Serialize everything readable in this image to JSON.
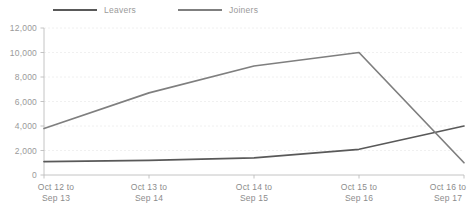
{
  "chart_data": {
    "type": "line",
    "title": "",
    "subtitle": "",
    "xlabel": "",
    "ylabel": "",
    "categories": [
      "Oct 12 to\nSep 13",
      "Oct 13 to\nSep 14",
      "Oct 14 to\nSep 15",
      "Oct 15 to\nSep 16",
      "Oct 16 to\nSep 17"
    ],
    "category_lines": [
      [
        "Oct 12 to",
        "Sep 13"
      ],
      [
        "Oct 13 to",
        "Sep 14"
      ],
      [
        "Oct 14 to",
        "Sep 15"
      ],
      [
        "Oct 15 to",
        "Sep 16"
      ],
      [
        "Oct 16 to",
        "Sep 17"
      ]
    ],
    "series": [
      {
        "name": "Leavers",
        "color": "#595959",
        "values": [
          1100,
          1200,
          1400,
          2100,
          4000
        ]
      },
      {
        "name": "Joiners",
        "color": "#7f7f7f",
        "values": [
          3800,
          6700,
          8900,
          10000,
          1000
        ]
      }
    ],
    "ylim": [
      0,
      12000
    ],
    "ytick_step": 2000,
    "ytick_values": [
      0,
      2000,
      4000,
      6000,
      8000,
      10000,
      12000
    ],
    "ytick_labels": [
      "0",
      "2,000",
      "4,000",
      "6,000",
      "8,000",
      "10,000",
      "12,000"
    ],
    "grid": true,
    "grid_axis": "y",
    "legend_position": "top"
  },
  "legend": {
    "items": [
      {
        "label": "Leavers",
        "color": "#595959"
      },
      {
        "label": "Joiners",
        "color": "#7f7f7f"
      }
    ]
  },
  "colors": {
    "background": "#ffffff",
    "axis": "#bdbdbd",
    "grid": "#ececec",
    "tick_text": "#9a9a9a",
    "category_text": "#8c8c8c",
    "leavers": "#595959",
    "joiners": "#7f7f7f"
  }
}
